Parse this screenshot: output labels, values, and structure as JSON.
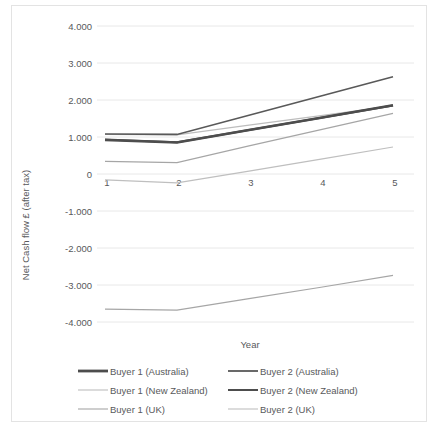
{
  "chart_data": {
    "type": "line",
    "title": "",
    "xlabel": "Year",
    "ylabel": "Net Cash flow £ (after tax)",
    "x": [
      1,
      2,
      3,
      4,
      5
    ],
    "xtick_labels": [
      "1",
      "2",
      "3",
      "4",
      "5"
    ],
    "ytick_labels": [
      "4.000",
      "3.000",
      "2.000",
      "1.000",
      "0",
      "-1.000",
      "-2.000",
      "-3.000",
      "-4.000"
    ],
    "ytick_values": [
      4000,
      3000,
      2000,
      1000,
      0,
      -1000,
      -2000,
      -3000,
      -4000
    ],
    "ylim": [
      -4000,
      4000
    ],
    "grid": true,
    "legend_position": "bottom",
    "series": [
      {
        "name": "Buyer 1 (Australia)",
        "color": "#4d4d4d",
        "width": 2.6,
        "values": [
          920,
          850,
          1190,
          1520,
          1860
        ]
      },
      {
        "name": "Buyer 2 (Australia)",
        "color": "#595959",
        "width": 1.6,
        "values": [
          1080,
          1070,
          1590,
          2110,
          2630
        ]
      },
      {
        "name": "Buyer 1 (New Zealand)",
        "color": "#bdbdbd",
        "width": 1.2,
        "values": [
          1070,
          1060,
          1320,
          1580,
          1840
        ]
      },
      {
        "name": "Buyer 2 (New Zealand)",
        "color": "#4d4d4d",
        "width": 2.0,
        "values": [
          930,
          860,
          1190,
          1520,
          1850
        ]
      },
      {
        "name": "Buyer 1 (UK)",
        "color": "#a6a6a6",
        "width": 1.2,
        "values": [
          340,
          310,
          760,
          1200,
          1640
        ]
      },
      {
        "name": "Buyer 2 (UK)",
        "color": "#bfbfbf",
        "width": 1.2,
        "values": [
          -160,
          -240,
          80,
          400,
          730
        ]
      }
    ],
    "negative_series": {
      "name": "Buyer 2 (UK) lower band",
      "color": "#a6a6a6",
      "width": 1.2,
      "values": [
        -3650,
        -3680,
        -3370,
        -3060,
        -2740
      ]
    }
  },
  "legend": {
    "entries": [
      {
        "label": "Buyer 1 (Australia)",
        "color": "#4d4d4d",
        "width": 2.8
      },
      {
        "label": "Buyer 2 (Australia)",
        "color": "#595959",
        "width": 1.8
      },
      {
        "label": "Buyer 1 (New Zealand)",
        "color": "#bdbdbd",
        "width": 1.1
      },
      {
        "label": "Buyer 2 (New Zealand)",
        "color": "#4d4d4d",
        "width": 2.0
      },
      {
        "label": "Buyer 1 (UK)",
        "color": "#a6a6a6",
        "width": 1.1
      },
      {
        "label": "Buyer 2 (UK)",
        "color": "#bfbfbf",
        "width": 1.1
      }
    ]
  },
  "colors": {
    "gridline": "#e8e8e8",
    "text": "#58595b",
    "frame": "#e3e3e3",
    "background": "#ffffff"
  }
}
